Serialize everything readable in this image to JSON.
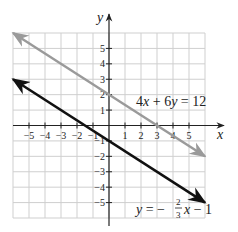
{
  "chart_data": {
    "type": "line",
    "title": "",
    "xlabel": "x",
    "ylabel": "y",
    "xlim": [
      -6,
      6
    ],
    "ylim": [
      -6,
      6
    ],
    "grid": true,
    "x_ticks": [
      -5,
      -4,
      -3,
      -2,
      -1,
      1,
      2,
      3,
      4,
      5
    ],
    "y_ticks": [
      5,
      4,
      3,
      2,
      1,
      -1,
      -2,
      -3,
      -4,
      -5
    ],
    "x_tick_labels": [
      "−5",
      "−4",
      "−3",
      "−2",
      "−1",
      "1",
      "2",
      "3",
      "4",
      "5"
    ],
    "y_tick_labels": [
      "5",
      "4",
      "3",
      "2",
      "1",
      "−1",
      "−2",
      "−3",
      "−4",
      "−5"
    ],
    "series": [
      {
        "name": "4x + 6y = 12",
        "equation": "4x + 6y = 12",
        "color": "#9a9a9a",
        "x": [
          -6,
          0,
          3,
          6
        ],
        "y": [
          6,
          2,
          0,
          -2
        ],
        "arrows": "both"
      },
      {
        "name": "y = -2/3 x - 1",
        "equation": "y = −(2/3)x − 1",
        "color": "#111111",
        "x": [
          -6,
          -1.5,
          0,
          6
        ],
        "y": [
          3,
          0,
          -1,
          -5
        ],
        "arrows": "both"
      }
    ],
    "annotations": [
      {
        "text": "4x + 6y = 12",
        "near": [
          4,
          1.6
        ]
      },
      {
        "text": "y = −2/3 x − 1",
        "near": [
          4,
          -5.3
        ]
      }
    ]
  },
  "labels": {
    "x_axis": "x",
    "y_axis": "y",
    "eq1": {
      "lhs_a": "4",
      "var_a": "x",
      "op": " + ",
      "lhs_b": "6",
      "var_b": "y",
      "eq": " = ",
      "rhs": "12"
    },
    "eq2": {
      "y": "y",
      "eq": " = −",
      "num": "2",
      "den": "3",
      "x": "x",
      "tail": " − 1"
    }
  },
  "colors": {
    "grid": "#cfcfcf",
    "axis": "#222222",
    "line1": "#9a9a9a",
    "line2": "#111111"
  }
}
